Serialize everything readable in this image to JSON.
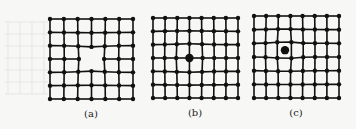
{
  "figure": {
    "panels": [
      {
        "id": "a",
        "label": "(a)",
        "x0": 50,
        "x1": 133,
        "y0": 19,
        "y1": 99,
        "cols": 7,
        "rows": 7,
        "defect": "vacancy",
        "defect_col": 3,
        "defect_row": 3,
        "label_x": 91,
        "label_y": 117
      },
      {
        "id": "b",
        "label": "(b)",
        "x0": 153,
        "x1": 238,
        "y0": 18,
        "y1": 98,
        "cols": 8,
        "rows": 7,
        "defect": "substitutional",
        "defect_col": 3,
        "defect_row": 3,
        "label_x": 195,
        "label_y": 116
      },
      {
        "id": "c",
        "label": "(c)",
        "x0": 254,
        "x1": 339,
        "y0": 16,
        "y1": 98,
        "cols": 8,
        "rows": 7,
        "defect": "interstitial",
        "defect_col": 2.55,
        "defect_row": 2.5,
        "label_x": 296,
        "label_y": 116
      }
    ],
    "colors": {
      "line": "#111111",
      "node": "#111111",
      "ghost": "#dcdcdc"
    }
  }
}
